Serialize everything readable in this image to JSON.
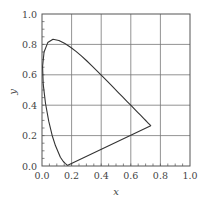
{
  "chart_data": {
    "type": "line",
    "title": "",
    "xlabel": "x",
    "ylabel": "y",
    "xlim": [
      0.0,
      1.0
    ],
    "ylim": [
      0.0,
      1.0
    ],
    "grid": true,
    "legend": null,
    "x_ticks": [
      "0.0",
      "0.2",
      "0.4",
      "0.6",
      "0.8",
      "1.0"
    ],
    "y_ticks": [
      "0.0",
      "0.2",
      "0.4",
      "0.6",
      "0.8",
      "1.0"
    ],
    "series": [
      {
        "name": "spectral locus (closed by purple line)",
        "closed": true,
        "x": [
          0.1741,
          0.1738,
          0.1733,
          0.1726,
          0.1714,
          0.1689,
          0.1644,
          0.1566,
          0.144,
          0.1241,
          0.0913,
          0.0687,
          0.0454,
          0.0235,
          0.0082,
          0.0039,
          0.0139,
          0.0389,
          0.0743,
          0.1142,
          0.1547,
          0.1929,
          0.2296,
          0.2658,
          0.3016,
          0.3373,
          0.3731,
          0.4087,
          0.4441,
          0.4788,
          0.5125,
          0.5448,
          0.5752,
          0.6029,
          0.627,
          0.6482,
          0.6658,
          0.6801,
          0.6915,
          0.7006,
          0.7079,
          0.714,
          0.719,
          0.723,
          0.726,
          0.7283,
          0.73,
          0.7311,
          0.732,
          0.7327,
          0.7334,
          0.734,
          0.7344,
          0.7347
        ],
        "y": [
          0.005,
          0.0049,
          0.0048,
          0.0048,
          0.0051,
          0.0069,
          0.0109,
          0.0177,
          0.0297,
          0.0578,
          0.1327,
          0.2007,
          0.295,
          0.4127,
          0.5384,
          0.6548,
          0.7502,
          0.812,
          0.8338,
          0.8262,
          0.8059,
          0.7816,
          0.7543,
          0.7243,
          0.6923,
          0.6589,
          0.6245,
          0.5896,
          0.5547,
          0.5202,
          0.4866,
          0.4544,
          0.4242,
          0.3965,
          0.3725,
          0.3514,
          0.334,
          0.3197,
          0.3083,
          0.2993,
          0.292,
          0.2859,
          0.2809,
          0.277,
          0.274,
          0.2717,
          0.27,
          0.2689,
          0.268,
          0.2673,
          0.2666,
          0.266,
          0.2656,
          0.2653
        ],
        "color": "#333333"
      }
    ]
  },
  "layout": {
    "plot_left": 42,
    "plot_top": 14,
    "plot_width": 148,
    "plot_height": 152,
    "grid_color": "#777777",
    "frame_color": "#555555",
    "line_color": "#333333"
  }
}
